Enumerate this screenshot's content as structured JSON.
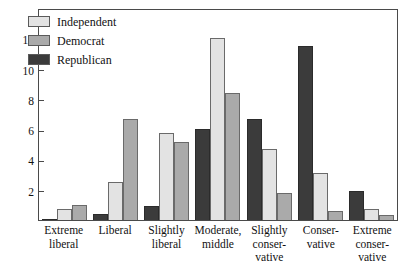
{
  "chart_data": {
    "type": "bar",
    "title": "",
    "xlabel": "",
    "ylabel": "",
    "ylim": [
      0,
      14
    ],
    "yticks": [
      2,
      4,
      6,
      8,
      10,
      12
    ],
    "grid": false,
    "legend_position": "top-left",
    "categories": [
      "Extreme liberal",
      "Liberal",
      "Slightly liberal",
      "Moderate, middle",
      "Slightly conservative",
      "Conservative",
      "Extreme conservative"
    ],
    "category_label_lines": [
      [
        "Extreme",
        "liberal"
      ],
      [
        "Liberal"
      ],
      [
        "Slightly",
        "liberal"
      ],
      [
        "Moderate,",
        "middle"
      ],
      [
        "Slightly",
        "conser-",
        "vative"
      ],
      [
        "Conser-",
        "vative"
      ],
      [
        "Extreme",
        "conser-",
        "vative"
      ]
    ],
    "bar_order": [
      "Republican",
      "Independent",
      "Democrat"
    ],
    "series": [
      {
        "name": "Independent",
        "color": "#e3e3e3",
        "values": [
          0.7,
          2.5,
          5.75,
          12.0,
          4.7,
          3.1,
          0.7
        ]
      },
      {
        "name": "Democrat",
        "color": "#aaaaaa",
        "values": [
          1.0,
          6.7,
          5.15,
          8.4,
          1.8,
          0.6,
          0.3
        ]
      },
      {
        "name": "Republican",
        "color": "#3b3b3b",
        "values": [
          0.05,
          0.4,
          0.9,
          6.0,
          6.7,
          11.5,
          1.9
        ]
      }
    ]
  },
  "legend": {
    "items": [
      {
        "label": "Independent",
        "color": "#e3e3e3"
      },
      {
        "label": "Democrat",
        "color": "#aaaaaa"
      },
      {
        "label": "Republican",
        "color": "#3b3b3b"
      }
    ]
  },
  "colors": {
    "axis": "#4a4a4a",
    "text": "#111111",
    "background": "#ffffff"
  }
}
